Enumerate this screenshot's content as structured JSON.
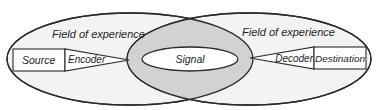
{
  "diagram": {
    "type": "communication-model",
    "left_field": {
      "label": "Field of experience"
    },
    "right_field": {
      "label": "Field of experience"
    },
    "nodes": {
      "source": "Source",
      "encoder": "Encoder",
      "signal": "Signal",
      "decoder": "Decoder",
      "destination": "Destination"
    },
    "colors": {
      "stroke": "#2a2a2a",
      "field_fill": "#f3f3f3",
      "overlap_fill": "#d2d2d2",
      "box_fill": "#ffffff"
    }
  }
}
